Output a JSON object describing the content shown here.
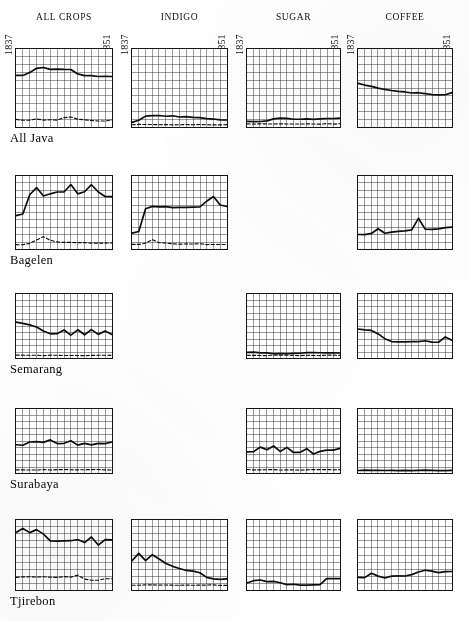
{
  "figure": {
    "background": "#ffffff",
    "ink": "#111111",
    "grid_color": "#2a2a2a",
    "n_cols": 4,
    "n_rows": 5,
    "grid_cols_per_panel": 14,
    "grid_rows_per_panel": 10
  },
  "columns": [
    {
      "label": "ALL CROPS",
      "x": 15,
      "w": 98
    },
    {
      "label": "INDIGO",
      "x": 131,
      "w": 97
    },
    {
      "label": "SUGAR",
      "x": 246,
      "w": 95
    },
    {
      "label": "COFFEE",
      "x": 357,
      "w": 96
    }
  ],
  "rows": [
    {
      "label": "All Java",
      "y": 48,
      "h": 80
    },
    {
      "label": "Bagelen",
      "y": 175,
      "h": 75
    },
    {
      "label": "Semarang",
      "y": 293,
      "h": 66
    },
    {
      "label": "Surabaya",
      "y": 408,
      "h": 66
    },
    {
      "label": "Tjirebon",
      "y": 519,
      "h": 72
    }
  ],
  "axis_years": {
    "start": "1837",
    "end": "1851"
  },
  "chart_data": {
    "type": "line",
    "title": "",
    "subtitle": "",
    "xlabel": "",
    "ylabel": "",
    "grid": true,
    "legend": "none",
    "x": [
      1837,
      1838,
      1839,
      1840,
      1841,
      1842,
      1843,
      1844,
      1845,
      1846,
      1847,
      1848,
      1849,
      1850,
      1851
    ],
    "xlim": [
      1837,
      1851
    ],
    "ylim": [
      0,
      1
    ],
    "series_styles": [
      {
        "name": "solid-series",
        "style": "solid",
        "width": 1.6
      },
      {
        "name": "dashed-series",
        "style": "dashed",
        "width": 1.2
      }
    ],
    "panels": [
      {
        "row": "All Java",
        "column": "ALL CROPS",
        "present": true,
        "series": [
          {
            "name": "solid-series",
            "style": "solid",
            "values": [
              0.66,
              0.66,
              0.7,
              0.75,
              0.76,
              0.74,
              0.74,
              0.74,
              0.74,
              0.68,
              0.66,
              0.66,
              0.65,
              0.65,
              0.65
            ]
          },
          {
            "name": "dashed-series",
            "style": "dashed",
            "values": [
              0.1,
              0.09,
              0.09,
              0.1,
              0.09,
              0.09,
              0.09,
              0.12,
              0.13,
              0.1,
              0.09,
              0.08,
              0.08,
              0.08,
              0.09
            ]
          }
        ]
      },
      {
        "row": "All Java",
        "column": "INDIGO",
        "present": true,
        "series": [
          {
            "name": "solid-series",
            "style": "solid",
            "values": [
              0.06,
              0.09,
              0.14,
              0.15,
              0.15,
              0.14,
              0.14,
              0.13,
              0.13,
              0.12,
              0.12,
              0.11,
              0.1,
              0.09,
              0.09
            ]
          },
          {
            "name": "dashed-series",
            "style": "dashed",
            "values": [
              0.03,
              0.03,
              0.03,
              0.03,
              0.03,
              0.03,
              0.03,
              0.03,
              0.03,
              0.03,
              0.03,
              0.03,
              0.03,
              0.03,
              0.03
            ]
          }
        ]
      },
      {
        "row": "All Java",
        "column": "SUGAR",
        "present": true,
        "series": [
          {
            "name": "solid-series",
            "style": "solid",
            "values": [
              0.07,
              0.07,
              0.07,
              0.08,
              0.1,
              0.11,
              0.11,
              0.1,
              0.1,
              0.1,
              0.1,
              0.1,
              0.11,
              0.11,
              0.11
            ]
          },
          {
            "name": "dashed-series",
            "style": "dashed",
            "values": [
              0.04,
              0.04,
              0.04,
              0.04,
              0.04,
              0.04,
              0.04,
              0.04,
              0.04,
              0.04,
              0.04,
              0.04,
              0.04,
              0.04,
              0.04
            ]
          }
        ]
      },
      {
        "row": "All Java",
        "column": "COFFEE",
        "present": true,
        "series": [
          {
            "name": "solid-series",
            "style": "solid",
            "values": [
              0.56,
              0.54,
              0.52,
              0.5,
              0.48,
              0.47,
              0.46,
              0.45,
              0.44,
              0.44,
              0.43,
              0.42,
              0.41,
              0.41,
              0.44
            ]
          }
        ]
      },
      {
        "row": "Bagelen",
        "column": "ALL CROPS",
        "present": true,
        "series": [
          {
            "name": "solid-series",
            "style": "solid",
            "values": [
              0.46,
              0.48,
              0.74,
              0.84,
              0.73,
              0.76,
              0.78,
              0.78,
              0.88,
              0.76,
              0.78,
              0.88,
              0.78,
              0.72,
              0.72
            ]
          },
          {
            "name": "dashed-series",
            "style": "dashed",
            "values": [
              0.06,
              0.06,
              0.08,
              0.12,
              0.17,
              0.12,
              0.1,
              0.09,
              0.09,
              0.09,
              0.09,
              0.08,
              0.08,
              0.08,
              0.08
            ]
          }
        ]
      },
      {
        "row": "Bagelen",
        "column": "INDIGO",
        "present": true,
        "series": [
          {
            "name": "solid-series",
            "style": "solid",
            "values": [
              0.22,
              0.24,
              0.55,
              0.58,
              0.58,
              0.58,
              0.57,
              0.57,
              0.57,
              0.57,
              0.58,
              0.65,
              0.72,
              0.6,
              0.58
            ]
          },
          {
            "name": "dashed-series",
            "style": "dashed",
            "values": [
              0.06,
              0.06,
              0.08,
              0.13,
              0.09,
              0.08,
              0.07,
              0.07,
              0.07,
              0.07,
              0.07,
              0.06,
              0.06,
              0.06,
              0.06
            ]
          }
        ]
      },
      {
        "row": "Bagelen",
        "column": "SUGAR",
        "present": false,
        "series": []
      },
      {
        "row": "Bagelen",
        "column": "COFFEE",
        "present": true,
        "series": [
          {
            "name": "solid-series",
            "style": "solid",
            "values": [
              0.2,
              0.2,
              0.21,
              0.28,
              0.22,
              0.23,
              0.24,
              0.25,
              0.26,
              0.42,
              0.27,
              0.27,
              0.28,
              0.29,
              0.3
            ]
          }
        ]
      },
      {
        "row": "Semarang",
        "column": "ALL CROPS",
        "present": true,
        "series": [
          {
            "name": "solid-series",
            "style": "solid",
            "values": [
              0.56,
              0.54,
              0.52,
              0.48,
              0.42,
              0.38,
              0.38,
              0.44,
              0.36,
              0.44,
              0.36,
              0.44,
              0.37,
              0.42,
              0.37
            ]
          },
          {
            "name": "dashed-series",
            "style": "dashed",
            "values": [
              0.04,
              0.04,
              0.04,
              0.04,
              0.04,
              0.04,
              0.04,
              0.04,
              0.04,
              0.04,
              0.04,
              0.04,
              0.04,
              0.04,
              0.04
            ]
          }
        ]
      },
      {
        "row": "Semarang",
        "column": "INDIGO",
        "present": false,
        "series": []
      },
      {
        "row": "Semarang",
        "column": "SUGAR",
        "present": true,
        "series": [
          {
            "name": "solid-series",
            "style": "solid",
            "values": [
              0.09,
              0.09,
              0.08,
              0.08,
              0.07,
              0.07,
              0.07,
              0.07,
              0.07,
              0.08,
              0.08,
              0.08,
              0.08,
              0.08,
              0.08
            ]
          },
          {
            "name": "dashed-series",
            "style": "dashed",
            "values": [
              0.04,
              0.04,
              0.04,
              0.04,
              0.04,
              0.04,
              0.04,
              0.04,
              0.04,
              0.04,
              0.04,
              0.04,
              0.04,
              0.04,
              0.04
            ]
          }
        ]
      },
      {
        "row": "Semarang",
        "column": "COFFEE",
        "present": true,
        "series": [
          {
            "name": "solid-series",
            "style": "solid",
            "values": [
              0.45,
              0.44,
              0.43,
              0.38,
              0.3,
              0.26,
              0.25,
              0.25,
              0.26,
              0.26,
              0.27,
              0.25,
              0.25,
              0.33,
              0.28
            ]
          }
        ]
      },
      {
        "row": "Surabaya",
        "column": "ALL CROPS",
        "present": true,
        "series": [
          {
            "name": "solid-series",
            "style": "solid",
            "values": [
              0.44,
              0.43,
              0.48,
              0.49,
              0.48,
              0.52,
              0.46,
              0.46,
              0.5,
              0.44,
              0.46,
              0.44,
              0.46,
              0.46,
              0.48
            ]
          },
          {
            "name": "dashed-series",
            "style": "dashed",
            "values": [
              0.05,
              0.05,
              0.05,
              0.05,
              0.05,
              0.05,
              0.05,
              0.05,
              0.05,
              0.05,
              0.05,
              0.05,
              0.05,
              0.05,
              0.05
            ]
          }
        ]
      },
      {
        "row": "Surabaya",
        "column": "INDIGO",
        "present": false,
        "series": []
      },
      {
        "row": "Surabaya",
        "column": "SUGAR",
        "present": true,
        "series": [
          {
            "name": "solid-series",
            "style": "solid",
            "values": [
              0.33,
              0.33,
              0.4,
              0.36,
              0.42,
              0.34,
              0.4,
              0.32,
              0.32,
              0.38,
              0.3,
              0.34,
              0.36,
              0.36,
              0.38
            ]
          },
          {
            "name": "dashed-series",
            "style": "dashed",
            "values": [
              0.05,
              0.05,
              0.05,
              0.05,
              0.05,
              0.05,
              0.05,
              0.05,
              0.05,
              0.05,
              0.05,
              0.05,
              0.05,
              0.05,
              0.05
            ]
          }
        ]
      },
      {
        "row": "Surabaya",
        "column": "COFFEE",
        "present": true,
        "series": [
          {
            "name": "solid-series",
            "style": "solid",
            "values": [
              0.04,
              0.04,
              0.04,
              0.04,
              0.04,
              0.04,
              0.04,
              0.04,
              0.04,
              0.04,
              0.04,
              0.04,
              0.04,
              0.04,
              0.04
            ]
          }
        ]
      },
      {
        "row": "Tjirebon",
        "column": "ALL CROPS",
        "present": true,
        "series": [
          {
            "name": "solid-series",
            "style": "solid",
            "values": [
              0.82,
              0.88,
              0.82,
              0.86,
              0.8,
              0.7,
              0.7,
              0.7,
              0.7,
              0.72,
              0.68,
              0.76,
              0.64,
              0.72,
              0.72
            ]
          },
          {
            "name": "dashed-series",
            "style": "dashed",
            "values": [
              0.18,
              0.19,
              0.19,
              0.19,
              0.19,
              0.18,
              0.18,
              0.19,
              0.18,
              0.21,
              0.16,
              0.14,
              0.14,
              0.16,
              0.16
            ]
          }
        ]
      },
      {
        "row": "Tjirebon",
        "column": "INDIGO",
        "present": true,
        "series": [
          {
            "name": "solid-series",
            "style": "solid",
            "values": [
              0.42,
              0.52,
              0.42,
              0.5,
              0.44,
              0.38,
              0.34,
              0.31,
              0.28,
              0.27,
              0.25,
              0.18,
              0.16,
              0.15,
              0.16
            ]
          },
          {
            "name": "dashed-series",
            "style": "dashed",
            "values": [
              0.07,
              0.07,
              0.07,
              0.07,
              0.07,
              0.07,
              0.07,
              0.07,
              0.07,
              0.07,
              0.07,
              0.07,
              0.07,
              0.07,
              0.07
            ]
          }
        ]
      },
      {
        "row": "Tjirebon",
        "column": "SUGAR",
        "present": true,
        "series": [
          {
            "name": "solid-series",
            "style": "solid",
            "values": [
              0.1,
              0.13,
              0.14,
              0.12,
              0.12,
              0.1,
              0.08,
              0.08,
              0.07,
              0.07,
              0.07,
              0.08,
              0.16,
              0.16,
              0.16
            ]
          }
        ]
      },
      {
        "row": "Tjirebon",
        "column": "COFFEE",
        "present": true,
        "series": [
          {
            "name": "solid-series",
            "style": "solid",
            "values": [
              0.18,
              0.18,
              0.24,
              0.2,
              0.17,
              0.2,
              0.2,
              0.2,
              0.22,
              0.26,
              0.28,
              0.27,
              0.25,
              0.26,
              0.26
            ]
          }
        ]
      }
    ]
  }
}
